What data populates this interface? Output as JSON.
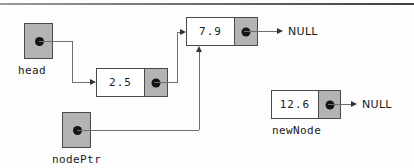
{
  "diagram": {
    "colors": {
      "pointer_fill": "#b3b3b3",
      "node_data_fill": "#ffffff",
      "outline": "#4a4a4a",
      "connector": "#6d6d6d",
      "text": "#1a1a1a"
    }
  },
  "pointers": [
    {
      "name": "head",
      "label": "head"
    },
    {
      "name": "nodePtr",
      "label": "nodePtr"
    }
  ],
  "nodes": [
    {
      "id": "node-2-5",
      "value": "2.5",
      "next_label": ""
    },
    {
      "id": "node-7-9",
      "value": "7.9",
      "next_label": "NULL"
    },
    {
      "id": "node-12-6",
      "value": "12.6",
      "next_label": "NULL",
      "variable_label": "newNode"
    }
  ],
  "null_labels": {
    "node_7_9": "NULL",
    "node_12_6": "NULL"
  },
  "variable_labels": {
    "head": "head",
    "node_ptr": "nodePtr",
    "new_node": "newNode"
  },
  "values": {
    "node_1": "2.5",
    "node_2": "7.9",
    "node_3": "12.6"
  }
}
